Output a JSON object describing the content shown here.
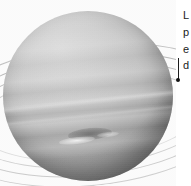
{
  "figure": {
    "plate_type": "grayscale astronomical photograph",
    "background_color": "#ffffff",
    "planet": {
      "name": "planet-disk",
      "surface_tone_light": "#dedede",
      "surface_tone_mid": "#b4b4b4",
      "surface_tone_dark": "#2a2a2a",
      "features": {
        "dark_spot_label": "",
        "bright_streak_label": "",
        "equatorial_band_label": "",
        "ring_arcs_label": ""
      }
    },
    "rings": {
      "count": 4,
      "color": "#8c8c8c"
    }
  },
  "caption": {
    "clipped": true,
    "lines": [
      "L",
      "p",
      "e",
      "d"
    ],
    "text_color": "#1a1a1a"
  },
  "leader": {
    "line_color": "#1c1c1c",
    "dot_color": "#121212"
  }
}
